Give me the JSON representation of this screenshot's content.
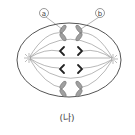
{
  "diagram": {
    "caption": "(나)",
    "labels": {
      "a": "a",
      "b": "b"
    },
    "colors": {
      "line": "#555555",
      "chromosome_grey": "#9a9a9a",
      "chromosome_black": "#222222"
    }
  }
}
